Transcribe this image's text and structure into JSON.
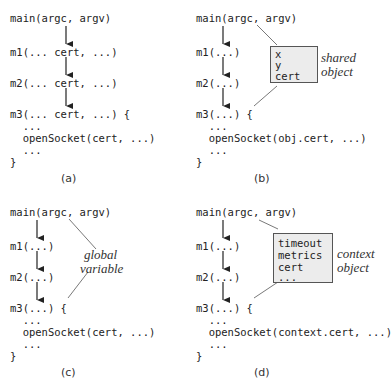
{
  "panels": {
    "a": {
      "caption": "(a)",
      "lines": {
        "main": "main(argc, argv)",
        "m1": "m1(... cert, ...)",
        "m2": "m2(... cert, ...)",
        "m3": "m3(... cert, ...) {",
        "dots1": "  ...",
        "call": "  openSocket(cert, ...)",
        "dots2": "  ...",
        "close": "}"
      }
    },
    "b": {
      "caption": "(b)",
      "lines": {
        "main": "main(argc, argv)",
        "m1": "m1(...)",
        "m2": "m2(...)",
        "m3": "m3(...) {",
        "dots1": "  ...",
        "call": "  openSocket(obj.cert, ...)",
        "dots2": "  ...",
        "close": "}"
      },
      "box_fields": [
        "x",
        "y",
        "cert"
      ],
      "label": [
        "shared",
        "object"
      ]
    },
    "c": {
      "caption": "(c)",
      "lines": {
        "main": "main(argc, argv)",
        "m1": "m1(...)",
        "m2": "m2(...)",
        "m3": "m3(...) {",
        "dots1": "  ...",
        "call": "  openSocket(cert, ...)",
        "dots2": "  ...",
        "close": "}"
      },
      "label": [
        "global",
        "variable"
      ]
    },
    "d": {
      "caption": "(d)",
      "lines": {
        "main": "main(argc, argv)",
        "m1": "m1(...)",
        "m2": "m2(...)",
        "m3": "m3(...) {",
        "dots1": "  ...",
        "call": "  openSocket(context.cert, ...)",
        "dots2": "  ...",
        "close": "}"
      },
      "box_fields": [
        "timeout",
        "metrics",
        "cert",
        "..."
      ],
      "label": [
        "context",
        "object"
      ]
    }
  }
}
